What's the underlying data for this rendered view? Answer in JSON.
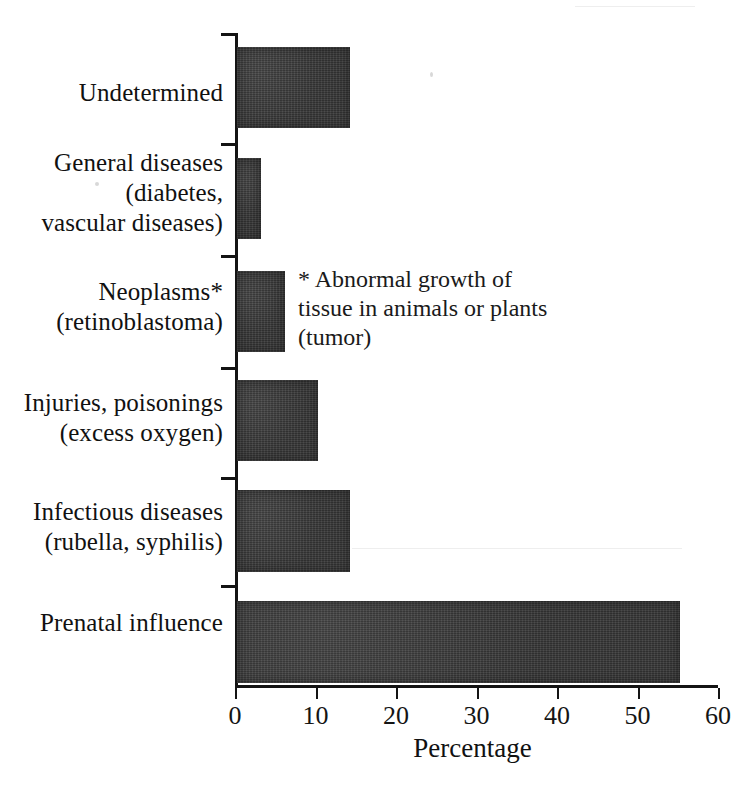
{
  "chart_data": {
    "type": "bar",
    "orientation": "horizontal",
    "title": "",
    "xlabel": "Percentage",
    "ylabel": "",
    "xlim": [
      0,
      60
    ],
    "xticks": [
      0,
      10,
      20,
      30,
      40,
      50,
      60
    ],
    "xtick_labels": [
      "0",
      "10",
      "20",
      "30",
      "40",
      "50",
      "60"
    ],
    "grid": false,
    "legend": null,
    "categories": [
      "Undetermined",
      "General diseases (diabetes, vascular diseases)",
      "Neoplasms* (retinoblastoma)",
      "Injuries, poisonings (excess oxygen)",
      "Infectious diseases (rubella, syphilis)",
      "Prenatal influence"
    ],
    "values": [
      14,
      3,
      6,
      10,
      14,
      55
    ],
    "bar_color": "#3b3b3b",
    "annotations": [
      "* Abnormal growth of tissue in animals or plants (tumor)"
    ]
  },
  "axis": {
    "x_title": "Percentage",
    "ticks": [
      {
        "value": 0,
        "label": "0"
      },
      {
        "value": 10,
        "label": "10"
      },
      {
        "value": 20,
        "label": "20"
      },
      {
        "value": 30,
        "label": "30"
      },
      {
        "value": 40,
        "label": "40"
      },
      {
        "value": 50,
        "label": "50"
      },
      {
        "value": 60,
        "label": "60"
      }
    ]
  },
  "categories": [
    {
      "id": "undetermined",
      "lines": [
        "Undetermined"
      ],
      "value": 14
    },
    {
      "id": "general-diseases",
      "lines": [
        "General diseases",
        "(diabetes,",
        "vascular diseases)"
      ],
      "value": 3
    },
    {
      "id": "neoplasms",
      "lines": [
        "Neoplasms*",
        "(retinoblastoma)"
      ],
      "value": 6
    },
    {
      "id": "injuries-poisonings",
      "lines": [
        "Injuries, poisonings",
        "(excess oxygen)"
      ],
      "value": 10
    },
    {
      "id": "infectious-diseases",
      "lines": [
        "Infectious diseases",
        "(rubella, syphilis)"
      ],
      "value": 14
    },
    {
      "id": "prenatal-influence",
      "lines": [
        "Prenatal influence"
      ],
      "value": 55
    }
  ],
  "footnote": {
    "lines": [
      "* Abnormal growth of",
      "tissue in animals or plants",
      "(tumor)"
    ]
  },
  "colors": {
    "bar": "#3b3b3b",
    "axis": "#141414",
    "text": "#111111",
    "background": "#ffffff"
  }
}
